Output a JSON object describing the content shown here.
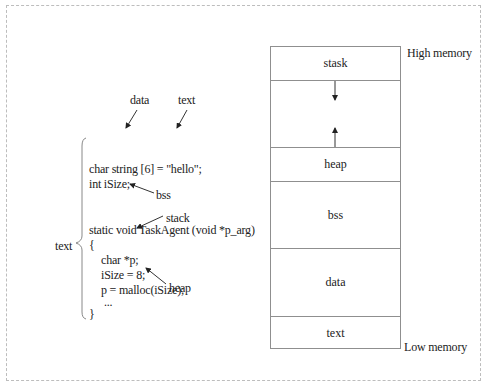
{
  "code": {
    "lines": [
      "char string [6] = \"hello\";",
      "int iSize;",
      "static void TaskAgent (void *p_arg)",
      "{",
      "char *p;",
      "iSize = 8;",
      "p = malloc(iSize);",
      "...",
      "}"
    ],
    "brace_label": "text"
  },
  "annotations": {
    "data": "data",
    "text": "text",
    "bss": "bss",
    "stack": "stack",
    "heap": "heap"
  },
  "memory": {
    "high_label": "High memory",
    "low_label": "Low memory",
    "segments": [
      {
        "label": "stask"
      },
      {
        "label": ""
      },
      {
        "label": "heap"
      },
      {
        "label": "bss"
      },
      {
        "label": "data"
      },
      {
        "label": "text"
      }
    ]
  }
}
